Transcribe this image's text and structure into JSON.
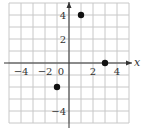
{
  "chart_data": {
    "type": "scatter",
    "title": "",
    "xlabel": "x",
    "ylabel": "y",
    "xlim": [
      -5,
      5
    ],
    "ylim": [
      -5,
      5
    ],
    "grid": true,
    "x_ticks": [
      -4,
      -2,
      0,
      2,
      4
    ],
    "y_ticks": [
      4,
      2,
      -4
    ],
    "x_tick_labels": [
      "−4",
      "−2",
      "0",
      "2",
      "4"
    ],
    "y_tick_labels": [
      "4",
      "2",
      "−4"
    ],
    "series": [
      {
        "name": "points",
        "points": [
          {
            "x": 1,
            "y": 4
          },
          {
            "x": 3,
            "y": 0
          },
          {
            "x": -1,
            "y": -2
          }
        ]
      }
    ],
    "colors": {
      "grid": "#c8c8c8",
      "axis": "#333333",
      "points": "#111111"
    }
  }
}
